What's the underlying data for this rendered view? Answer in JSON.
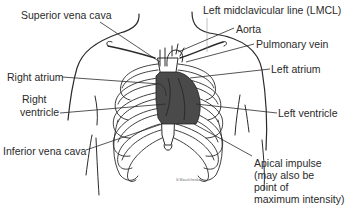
{
  "diagram": {
    "type": "anatomical-illustration",
    "colors": {
      "background": "#ffffff",
      "line": "#2a2a2a",
      "heart_fill": "#4a4a4a",
      "text": "#2a2a2a"
    },
    "labels": {
      "superior_vena_cava": "Superior vena cava",
      "lmcl": "Left midclavicular line (LMCL)",
      "aorta": "Aorta",
      "pulmonary_vein": "Pulmonary vein",
      "right_atrium": "Right atrium",
      "left_atrium": "Left atrium",
      "right_ventricle_1": "Right",
      "right_ventricle_2": "ventricle",
      "left_ventricle": "Left ventricle",
      "inferior_vena_cava": "Inferior vena cava",
      "apical_impulse_1": "Apical impulse",
      "apical_impulse_2": "(may also be",
      "apical_impulse_3": "point of",
      "apical_impulse_4": "maximum intensity)"
    },
    "signature": "G.Wassilchenko"
  }
}
